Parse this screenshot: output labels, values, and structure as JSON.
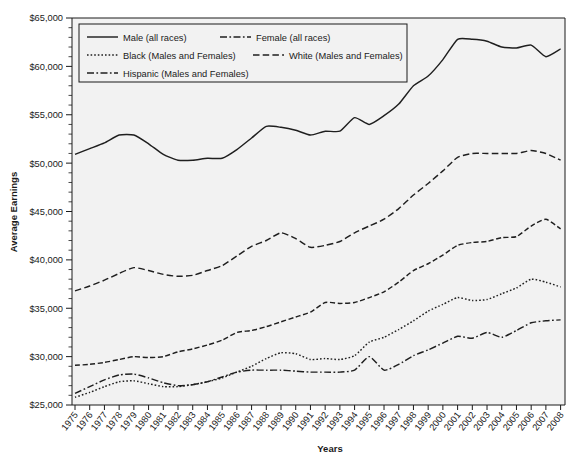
{
  "chart_data": {
    "type": "line",
    "title": "",
    "xlabel": "Years",
    "ylabel": "Average Earnings",
    "ylim": [
      25000,
      65000
    ],
    "ytick_step": 5000,
    "yminor_step": 1000,
    "grid": false,
    "legend_position": "top-left",
    "ytick_labels": [
      "$25,000",
      "$30,000",
      "$35,000",
      "$40,000",
      "$45,000",
      "$50,000",
      "$55,000",
      "$60,000",
      "$65,000"
    ],
    "ytick_values": [
      25000,
      30000,
      35000,
      40000,
      45000,
      50000,
      55000,
      60000,
      65000
    ],
    "categories": [
      "1975",
      "1976",
      "1977",
      "1978",
      "1979",
      "1980",
      "1981",
      "1982",
      "1983",
      "1984",
      "1985",
      "1986",
      "1987",
      "1988",
      "1989",
      "1990",
      "1991",
      "1992",
      "1993",
      "1994",
      "1995",
      "1996",
      "1997",
      "1998",
      "1999",
      "2000",
      "2001",
      "2002",
      "2003",
      "2004",
      "2005",
      "2006",
      "2007",
      "2008"
    ],
    "x": [
      1975,
      1976,
      1977,
      1978,
      1979,
      1980,
      1981,
      1982,
      1983,
      1984,
      1985,
      1986,
      1987,
      1988,
      1989,
      1990,
      1991,
      1992,
      1993,
      1994,
      1995,
      1996,
      1997,
      1998,
      1999,
      2000,
      2001,
      2002,
      2003,
      2004,
      2005,
      2006,
      2007,
      2008
    ],
    "series": [
      {
        "name": "Male (all races)",
        "style": "solid",
        "color": "#1f1f1f",
        "values": [
          50900,
          51500,
          52100,
          52900,
          52900,
          52000,
          50900,
          50300,
          50300,
          50500,
          50500,
          51400,
          52600,
          53800,
          53700,
          53400,
          52900,
          53300,
          53300,
          54700,
          54000,
          54900,
          56100,
          58000,
          59000,
          60700,
          62800,
          62800,
          62600,
          62000,
          61900,
          62200,
          61000,
          61800
        ]
      },
      {
        "name": "Female (all races)",
        "style": "dashed",
        "color": "#1f1f1f",
        "values": [
          29100,
          29200,
          29400,
          29700,
          30000,
          29900,
          30000,
          30500,
          30800,
          31200,
          31700,
          32500,
          32700,
          33100,
          33600,
          34100,
          34600,
          35600,
          35500,
          35600,
          36100,
          36700,
          37700,
          38900,
          39600,
          40500,
          41500,
          41800,
          41900,
          42300,
          42400,
          43500,
          44200,
          43200
        ]
      },
      {
        "name": "Black (Males and Females)",
        "style": "dotted",
        "color": "#1f1f1f",
        "values": [
          25800,
          26300,
          26900,
          27400,
          27500,
          27200,
          26900,
          26900,
          27100,
          27400,
          27800,
          28400,
          29000,
          29800,
          30400,
          30300,
          29700,
          29800,
          29700,
          30100,
          31500,
          32000,
          32800,
          33700,
          34700,
          35400,
          36100,
          35800,
          35900,
          36500,
          37100,
          38000,
          37700,
          37200
        ]
      },
      {
        "name": "White (Males and Females)",
        "style": "dashed-long",
        "color": "#4a4a4a",
        "values": [
          36800,
          37300,
          37900,
          38600,
          39200,
          38900,
          38500,
          38300,
          38400,
          38900,
          39400,
          40400,
          41400,
          42000,
          42800,
          42200,
          41300,
          41500,
          41900,
          42800,
          43500,
          44200,
          45300,
          46700,
          47900,
          49200,
          50600,
          51000,
          51000,
          51000,
          51000,
          51300,
          51000,
          50300
        ]
      },
      {
        "name": "Hispanic (Males and Females)",
        "style": "dash-dot",
        "color": "#1f1f1f",
        "values": [
          26200,
          26900,
          27600,
          28100,
          28200,
          27800,
          27300,
          27000,
          27100,
          27400,
          27900,
          28400,
          28600,
          28600,
          28600,
          28500,
          28400,
          28400,
          28400,
          28600,
          30000,
          28600,
          29200,
          30100,
          30700,
          31400,
          32100,
          31900,
          32500,
          32000,
          32700,
          33500,
          33700,
          33800
        ]
      }
    ],
    "legend_entries": [
      {
        "label": "Male (all races)",
        "style": "solid"
      },
      {
        "label": "Female (all races)",
        "style": "dash-dot"
      },
      {
        "label": "Black (Males and Females)",
        "style": "dotted"
      },
      {
        "label": "White (Males and Females)",
        "style": "dashed-long"
      },
      {
        "label": "Hispanic (Males and Females)",
        "style": "dash-dot"
      }
    ]
  }
}
